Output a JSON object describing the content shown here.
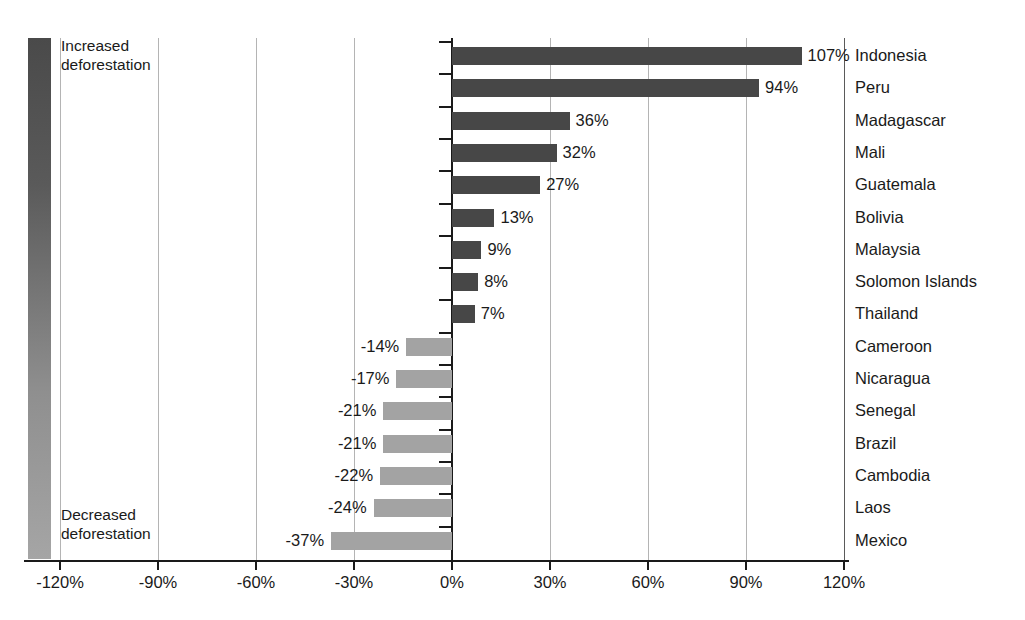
{
  "chart_data": {
    "type": "bar",
    "orientation": "horizontal",
    "title": "",
    "xlabel": "",
    "ylabel": "",
    "xlim": [
      -120,
      120
    ],
    "grid": true,
    "grid_axis": "x",
    "xticks": [
      "-120%",
      "-90%",
      "-60%",
      "-30%",
      "0%",
      "30%",
      "60%",
      "90%",
      "120%"
    ],
    "xtick_values": [
      -120,
      -90,
      -60,
      -30,
      0,
      30,
      60,
      90,
      120
    ],
    "categories": [
      "Indonesia",
      "Peru",
      "Madagascar",
      "Mali",
      "Guatemala",
      "Bolivia",
      "Malaysia",
      "Solomon Islands",
      "Thailand",
      "Cameroon",
      "Nicaragua",
      "Senegal",
      "Brazil",
      "Cambodia",
      "Laos",
      "Mexico"
    ],
    "values": [
      107,
      94,
      36,
      32,
      27,
      13,
      9,
      8,
      7,
      -14,
      -17,
      -21,
      -21,
      -22,
      -24,
      -37
    ],
    "value_labels": [
      "107%",
      "94%",
      "36%",
      "32%",
      "27%",
      "13%",
      "9%",
      "8%",
      "7%",
      "-14%",
      "-17%",
      "-21%",
      "-21%",
      "-22%",
      "-24%",
      "-37%"
    ],
    "colors": {
      "positive": "#474747",
      "negative": "#a3a3a3",
      "axis": "#1a1a1a",
      "grid": "#b4b4b4",
      "background": "#ffffff"
    }
  },
  "legend": {
    "position": "left-vertical-gradient",
    "gradient_top_color": "#4a4a4a",
    "gradient_bottom_color": "#a5a5a5",
    "top_label": "Increased\ndeforestation",
    "bottom_label": "Decreased\ndeforestation"
  }
}
